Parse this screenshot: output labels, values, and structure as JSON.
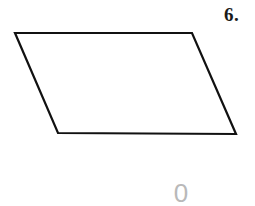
{
  "canvas": {
    "width": 255,
    "height": 206,
    "background_color": "#ffffff"
  },
  "problem": {
    "number_label": "6.",
    "number_color": "#1a1a1a"
  },
  "figure": {
    "name": "parallelogram",
    "stroke_color": "#111111",
    "stroke_width": 2.2,
    "fill_color": "none",
    "points": "15,33 192,33 236,134 58,133",
    "vertices": [
      {
        "name": "top-left",
        "x": 15,
        "y": 33
      },
      {
        "name": "top-right",
        "x": 192,
        "y": 33
      },
      {
        "name": "bottom-right",
        "x": 236,
        "y": 134
      },
      {
        "name": "bottom-left",
        "x": 58,
        "y": 133
      }
    ]
  },
  "watermark": {
    "text": "0",
    "color": "#b9b9b9"
  }
}
